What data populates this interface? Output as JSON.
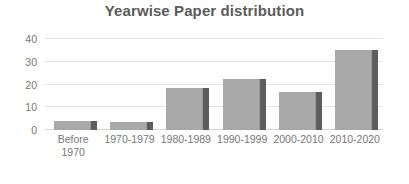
{
  "chart_data": {
    "type": "bar",
    "title": "Yearwise Paper distribution",
    "xlabel": "",
    "ylabel": "",
    "categories": [
      "Before 1970",
      "1970-1979",
      "1980-1989",
      "1990-1999",
      "2000-2010",
      "2010-2020"
    ],
    "values": [
      4,
      3.5,
      18.5,
      22.5,
      16.5,
      35
    ],
    "series": [
      {
        "name": "Papers",
        "values": [
          4,
          3.5,
          18.5,
          22.5,
          16.5,
          35
        ]
      }
    ],
    "ylim": [
      0,
      40
    ],
    "yticks": [
      0,
      10,
      20,
      30,
      40
    ],
    "ytick_labels": [
      "0",
      "10",
      "20",
      "30",
      "40"
    ],
    "grid": true,
    "grid_axis": "y",
    "legend": false,
    "legend_position": "none",
    "bar_color": "#a8a8a8",
    "bar_shadow_color": "#5d5d5d",
    "gridline_color": "#e2e2e2",
    "title_color": "#5b5b5b",
    "tick_label_color": "#767676",
    "background_color": "#ffffff"
  }
}
